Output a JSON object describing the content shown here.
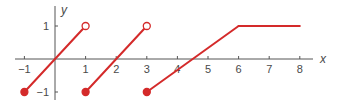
{
  "chart_data": {
    "type": "line",
    "title": "",
    "xlabel": "x",
    "ylabel": "y",
    "xlim": [
      -1,
      8
    ],
    "ylim": [
      -1,
      1
    ],
    "x_ticks": [
      -1,
      1,
      2,
      3,
      4,
      5,
      6,
      7,
      8
    ],
    "x_tick_labels": [
      "−1",
      "1",
      "2",
      "3",
      "4",
      "5",
      "6",
      "7",
      "8"
    ],
    "y_ticks": [
      1,
      -1
    ],
    "y_tick_labels": [
      "1",
      "−1"
    ],
    "grid": false,
    "legend": null,
    "line_color": "#d42a2a",
    "series": [
      {
        "name": "segment-1",
        "points": [
          [
            -1,
            -1
          ],
          [
            1,
            1
          ]
        ],
        "start": "closed",
        "end": "open"
      },
      {
        "name": "segment-2",
        "points": [
          [
            1,
            -1
          ],
          [
            3,
            1
          ]
        ],
        "start": "closed",
        "end": "open"
      },
      {
        "name": "segment-3",
        "points": [
          [
            3,
            -1
          ],
          [
            6,
            1
          ]
        ],
        "start": "closed",
        "end": "none"
      },
      {
        "name": "segment-4",
        "points": [
          [
            6,
            1
          ],
          [
            8,
            1
          ]
        ],
        "start": "none",
        "end": "none"
      }
    ]
  }
}
